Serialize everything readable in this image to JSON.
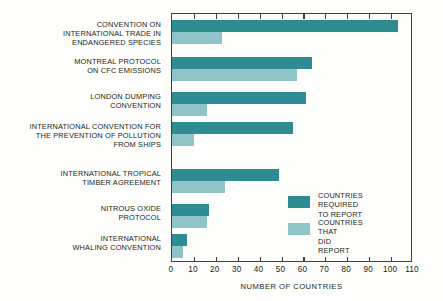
{
  "chart_data": {
    "type": "bar",
    "orientation": "horizontal",
    "title": "",
    "xlabel": "NUMBER OF COUNTRIES",
    "ylabel": "",
    "xlim": [
      0,
      110
    ],
    "xticks": [
      0,
      10,
      20,
      30,
      40,
      50,
      60,
      70,
      80,
      90,
      100,
      110
    ],
    "xtick_labels": [
      "0",
      "10",
      "20",
      "30",
      "40",
      "50",
      "60",
      "70",
      "80",
      "90",
      "100",
      "110"
    ],
    "grid": false,
    "legend_position": "inside-lower-right",
    "categories": [
      "CONVENTION ON\nINTERNATIONAL TRADE IN\nENDANGERED SPECIES",
      "MONTREAL PROTOCOL\nON CFC EMISSIONS",
      "LONDON DUMPING\nCONVENTION",
      "INTERNATIONAL CONVENTION FOR\nTHE PREVENTION OF POLLUTION\nFROM SHIPS",
      "INTERNATIONAL TROPICAL\nTIMBER AGREEMENT",
      "NITROUS OXIDE\nPROTOCOL",
      "INTERNATIONAL\nWHALING CONVENTION"
    ],
    "series": [
      {
        "name": "COUNTRIES REQUIRED\nTO REPORT",
        "color": "#2e8c92",
        "values": [
          103,
          64,
          61,
          55,
          49,
          17,
          7
        ]
      },
      {
        "name": "COUNTRIES THAT\nDID REPORT",
        "color": "#8fc4c9",
        "values": [
          23,
          57,
          16,
          10,
          24,
          16,
          5
        ]
      }
    ]
  },
  "legend": {
    "items": [
      {
        "label": "COUNTRIES REQUIRED\nTO REPORT",
        "color": "#2e8c92"
      },
      {
        "label": "COUNTRIES THAT\nDID REPORT",
        "color": "#8fc4c9"
      }
    ]
  },
  "colors": {
    "dark_teal": "#2e8c92",
    "light_teal": "#8fc4c9",
    "axis": "#3f3f3f",
    "text": "#231f20",
    "background": "#fdfdfc"
  }
}
